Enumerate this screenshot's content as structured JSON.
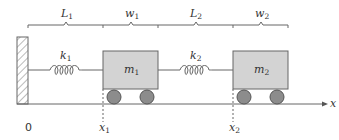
{
  "diagram": {
    "colors": {
      "line": "#555555",
      "mass_fill": "#d3d3d3",
      "mass_stroke": "#666666",
      "wheel_fill": "#8c8c8c",
      "wheel_stroke": "#555555",
      "text": "#333333"
    },
    "dimensions": [
      {
        "label": "L",
        "sub": "1"
      },
      {
        "label": "w",
        "sub": "1"
      },
      {
        "label": "L",
        "sub": "2"
      },
      {
        "label": "w",
        "sub": "2"
      }
    ],
    "springs": [
      {
        "label": "k",
        "sub": "1"
      },
      {
        "label": "k",
        "sub": "2"
      }
    ],
    "masses": [
      {
        "label": "m",
        "sub": "1"
      },
      {
        "label": "m",
        "sub": "2"
      }
    ],
    "positions": [
      {
        "label": "x",
        "sub": "1"
      },
      {
        "label": "x",
        "sub": "2"
      }
    ],
    "origin_label": "0",
    "axis_label": "x"
  }
}
